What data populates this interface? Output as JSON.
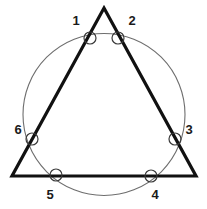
{
  "figure": {
    "canvas": {
      "width": 207,
      "height": 209,
      "background": "#ffffff"
    },
    "styles": {
      "triangle_stroke": "#111111",
      "triangle_stroke_width": 3.2,
      "circle_stroke": "#6e6e6e",
      "circle_stroke_width": 1.1,
      "marker_stroke": "#3a3a3a",
      "marker_stroke_width": 1.2,
      "marker_fill": "none",
      "label_color": "#1a1a1a"
    },
    "triangle": {
      "name": "triangle",
      "apex": {
        "x": 104,
        "y": 8
      },
      "bottom_left": {
        "x": 12,
        "y": 176
      },
      "bottom_right": {
        "x": 196,
        "y": 176
      },
      "points_attr": "104,8 196,176 12,176"
    },
    "circle": {
      "name": "circumscribing-circle",
      "cx": 104,
      "cy": 114.5,
      "r": 81
    },
    "markers": [
      {
        "id": "1",
        "label": "1",
        "cx": 90,
        "cy": 38,
        "r": 6,
        "label_x": 76,
        "label_y": 22
      },
      {
        "id": "2",
        "label": "2",
        "cx": 118,
        "cy": 38,
        "r": 6,
        "label_x": 132,
        "label_y": 22
      },
      {
        "id": "3",
        "label": "3",
        "cx": 175,
        "cy": 139,
        "r": 6,
        "label_x": 189,
        "label_y": 131
      },
      {
        "id": "4",
        "label": "4",
        "cx": 151,
        "cy": 176,
        "r": 6,
        "label_x": 155,
        "label_y": 196
      },
      {
        "id": "5",
        "label": "5",
        "cx": 56,
        "cy": 175,
        "r": 6,
        "label_x": 50,
        "label_y": 196
      },
      {
        "id": "6",
        "label": "6",
        "cx": 32,
        "cy": 139,
        "r": 6,
        "label_x": 18,
        "label_y": 131
      }
    ]
  }
}
